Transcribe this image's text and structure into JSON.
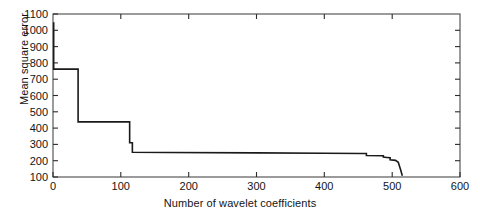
{
  "chart_data": {
    "type": "line",
    "title": "",
    "xlabel": "Number of wavelet coefficients",
    "ylabel": "Mean square error",
    "xlim": [
      0,
      600
    ],
    "ylim": [
      100,
      1100
    ],
    "xticks": [
      0,
      100,
      200,
      300,
      400,
      500,
      600
    ],
    "yticks": [
      100,
      200,
      300,
      400,
      500,
      600,
      700,
      800,
      900,
      1000,
      1100
    ],
    "xtick_labels": [
      "0",
      "100",
      "200",
      "300",
      "400",
      "500",
      "600"
    ],
    "ytick_labels": [
      "100",
      "200",
      "300",
      "400",
      "500",
      "600",
      "700",
      "800",
      "900",
      "1000",
      "1100"
    ],
    "grid": false,
    "legend": null,
    "line_color": "#1a1a1a",
    "line_width": 1.6,
    "series": [
      {
        "name": "Mean square error vs number of wavelet coefficients",
        "x": [
          1,
          1,
          37,
          37,
          113,
          113,
          117,
          117,
          170,
          300,
          400,
          455,
          462,
          462,
          487,
          487,
          492,
          497,
          497,
          505,
          509,
          512,
          515
        ],
        "y": [
          1050,
          762,
          762,
          438,
          438,
          310,
          310,
          252,
          250,
          248,
          246,
          244,
          244,
          232,
          230,
          222,
          220,
          218,
          205,
          202,
          190,
          150,
          108
        ]
      }
    ]
  },
  "axes": {
    "tick_direction": "in",
    "box": true,
    "background": "#ffffff",
    "frame_color": "#4a4a4a"
  }
}
